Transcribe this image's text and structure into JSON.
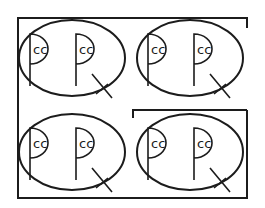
{
  "diagram": {
    "type": "symbol-grid",
    "stroke_color": "#1c1c1c",
    "background": "#ffffff",
    "groups": [
      {
        "id": "top-left",
        "cx": 72,
        "cy": 58,
        "glyphs": [
          {
            "label": "cc",
            "tail": false
          },
          {
            "label": "cc",
            "tail": true
          }
        ]
      },
      {
        "id": "top-right",
        "cx": 190,
        "cy": 58,
        "glyphs": [
          {
            "label": "cc",
            "tail": false
          },
          {
            "label": "cc",
            "tail": true
          }
        ]
      },
      {
        "id": "bottom-left",
        "cx": 72,
        "cy": 152,
        "glyphs": [
          {
            "label": "cc",
            "tail": false
          },
          {
            "label": "cc",
            "tail": true
          }
        ]
      },
      {
        "id": "bottom-right",
        "cx": 190,
        "cy": 152,
        "glyphs": [
          {
            "label": "cc",
            "tail": false
          },
          {
            "label": "cc",
            "tail": true
          }
        ]
      }
    ],
    "labels": {
      "g0a": "cc",
      "g0b": "cc",
      "g1a": "cc",
      "g1b": "cc",
      "g2a": "cc",
      "g2b": "cc",
      "g3a": "cc",
      "g3b": "cc"
    },
    "outer_frame": "encloses all four groups, open tick at top-right",
    "inner_bracket": "encloses bottom-right group"
  }
}
